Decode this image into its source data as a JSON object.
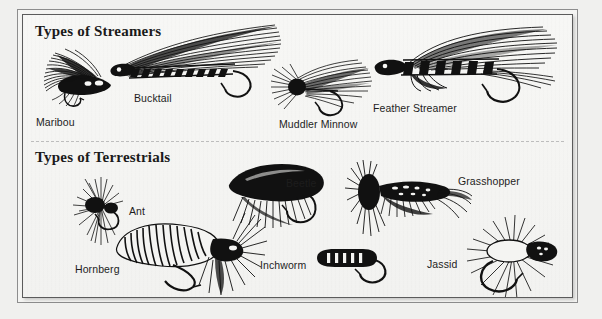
{
  "page": {
    "background_color": "#f0f0ee",
    "panel_background": "#f6f6f4",
    "frame_color": "#5b5b5b",
    "divider_color": "#bdbdbd",
    "ink_color": "#111111"
  },
  "sections": [
    {
      "id": "streamers",
      "title": "Types of Streamers",
      "specimens": [
        {
          "name": "Maribou",
          "label": "Maribou"
        },
        {
          "name": "Bucktail",
          "label": "Bucktail"
        },
        {
          "name": "Muddler Minnow",
          "label": "Muddler Minnow"
        },
        {
          "name": "Feather Streamer",
          "label": "Feather Streamer"
        }
      ]
    },
    {
      "id": "terrestrials",
      "title": "Types of Terrestrials",
      "specimens": [
        {
          "name": "Ant",
          "label": "Ant"
        },
        {
          "name": "Beetle",
          "label": "Beetle"
        },
        {
          "name": "Grasshopper",
          "label": "Grasshopper"
        },
        {
          "name": "Hornberg",
          "label": "Hornberg"
        },
        {
          "name": "Inchworm",
          "label": "Inchworm"
        },
        {
          "name": "Jassid",
          "label": "Jassid"
        }
      ]
    }
  ]
}
